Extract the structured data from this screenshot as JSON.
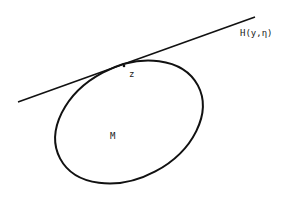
{
  "diagram": {
    "line_label": "H(y,η)",
    "point_label": "z",
    "region_label": "M",
    "stroke_color": "#111111",
    "background": "#ffffff"
  }
}
